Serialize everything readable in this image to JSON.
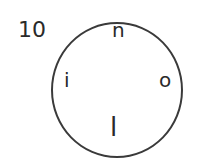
{
  "item": {
    "number": "10",
    "letters": {
      "top": "n",
      "left": "i",
      "right": "o",
      "bottom": "l"
    }
  }
}
